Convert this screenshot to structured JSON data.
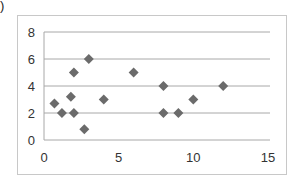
{
  "fragment": {
    "paren": ")"
  },
  "chart_data": {
    "type": "scatter",
    "title": "",
    "xlabel": "",
    "ylabel": "",
    "xlim": [
      0,
      15
    ],
    "ylim": [
      0,
      8
    ],
    "xticks": [
      "0",
      "5",
      "10",
      "15"
    ],
    "yticks": [
      "0",
      "2",
      "4",
      "6",
      "8"
    ],
    "grid": "horizontal",
    "legend": "none",
    "marker": "diamond",
    "marker_color": "#6b6b6b",
    "series": [
      {
        "name": "Series1",
        "points": [
          {
            "x": 0.7,
            "y": 2.7
          },
          {
            "x": 1.2,
            "y": 2.0
          },
          {
            "x": 1.8,
            "y": 3.2
          },
          {
            "x": 2.0,
            "y": 5.0
          },
          {
            "x": 2.0,
            "y": 2.0
          },
          {
            "x": 2.7,
            "y": 0.8
          },
          {
            "x": 3.0,
            "y": 6.0
          },
          {
            "x": 4.0,
            "y": 3.0
          },
          {
            "x": 6.0,
            "y": 5.0
          },
          {
            "x": 8.0,
            "y": 4.0
          },
          {
            "x": 8.0,
            "y": 2.0
          },
          {
            "x": 9.0,
            "y": 2.0
          },
          {
            "x": 10.0,
            "y": 3.0
          },
          {
            "x": 12.0,
            "y": 4.0
          }
        ]
      }
    ]
  }
}
